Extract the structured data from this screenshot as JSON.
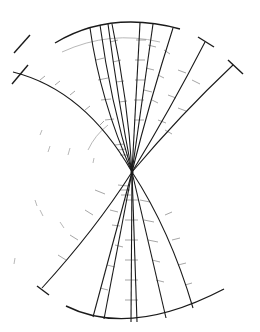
{
  "diagram": {
    "type": "particle-track-event",
    "width": 260,
    "height": 332,
    "colors": {
      "track": "#1a1a1a",
      "tick": "#444444",
      "faint": "#b8b8b8",
      "background": "#ffffff"
    },
    "vertex": {
      "x": 132,
      "y": 172
    },
    "boundary_arcs": [
      {
        "id": "top-arc",
        "d": "M55,43 Q110,10 180,29"
      },
      {
        "id": "bottom-arc",
        "d": "M66,306 Q130,338 224,289"
      },
      {
        "id": "left-upper-arc",
        "d": "M14,53 L30,35"
      }
    ],
    "faint_arcs": [
      {
        "d": "M62,52 Q110,30 160,42"
      },
      {
        "d": "M88,150 Q95,135 108,125"
      },
      {
        "d": "M40,135 L42,130"
      },
      {
        "d": "M48,152 L50,146"
      },
      {
        "d": "M68,155 L70,148"
      },
      {
        "d": "M93,163 L94,158"
      },
      {
        "d": "M35,200 L37,206"
      },
      {
        "d": "M40,210 L43,216"
      },
      {
        "d": "M60,222 L64,228"
      },
      {
        "d": "M15,258 L14,264"
      }
    ],
    "tracks_up": [
      {
        "id": "t1",
        "d": "M132,172 Q85,90 13,72",
        "cap": {
          "x1": 12,
          "y1": 84,
          "x2": 28,
          "y2": 65
        }
      },
      {
        "id": "t2",
        "d": "M132,172 Q100,100 90,28"
      },
      {
        "id": "t3",
        "d": "M132,172 Q110,100 100,25"
      },
      {
        "id": "t4",
        "d": "M132,172 Q118,100 108,24"
      },
      {
        "id": "t5",
        "d": "M132,172 Q128,100 112,24"
      },
      {
        "id": "t6",
        "d": "M132,172 L140,23"
      },
      {
        "id": "t7",
        "d": "M132,172 Q142,100 153,24"
      },
      {
        "id": "t8",
        "d": "M132,172 Q150,100 173,28"
      },
      {
        "id": "t9",
        "d": "M132,172 Q170,110 205,42",
        "cap": {
          "x1": 198,
          "y1": 37,
          "x2": 214,
          "y2": 47
        }
      },
      {
        "id": "t10",
        "d": "M132,172 Q180,115 233,65",
        "cap": {
          "x1": 228,
          "y1": 60,
          "x2": 243,
          "y2": 74
        }
      }
    ],
    "tracks_down": [
      {
        "id": "b1",
        "d": "M132,172 Q95,230 42,288",
        "cap": {
          "x1": 37,
          "y1": 286,
          "x2": 49,
          "y2": 295
        }
      },
      {
        "id": "b2",
        "d": "M132,172 L93,317"
      },
      {
        "id": "b3",
        "d": "M132,172 L104,319"
      },
      {
        "id": "b4",
        "d": "M132,172 L131,322"
      },
      {
        "id": "b5",
        "d": "M132,172 L137,322"
      },
      {
        "id": "b6",
        "d": "M132,172 L166,318"
      },
      {
        "id": "b7",
        "d": "M132,172 Q170,230 193,308"
      }
    ],
    "ticks": [
      [
        96,
        60,
        104,
        58
      ],
      [
        98,
        80,
        108,
        78
      ],
      [
        101,
        100,
        111,
        99
      ],
      [
        105,
        120,
        114,
        119
      ],
      [
        110,
        42,
        118,
        40
      ],
      [
        113,
        62,
        121,
        60
      ],
      [
        116,
        82,
        124,
        81
      ],
      [
        119,
        102,
        127,
        101
      ],
      [
        136,
        40,
        146,
        40
      ],
      [
        135,
        60,
        145,
        60
      ],
      [
        135,
        80,
        145,
        80
      ],
      [
        134,
        100,
        144,
        100
      ],
      [
        134,
        120,
        144,
        120
      ],
      [
        148,
        45,
        156,
        47
      ],
      [
        146,
        68,
        154,
        70
      ],
      [
        144,
        90,
        152,
        92
      ],
      [
        164,
        50,
        170,
        54
      ],
      [
        158,
        75,
        164,
        78
      ],
      [
        152,
        100,
        158,
        103
      ],
      [
        178,
        70,
        186,
        73
      ],
      [
        168,
        95,
        176,
        98
      ],
      [
        158,
        120,
        166,
        123
      ],
      [
        192,
        80,
        200,
        84
      ],
      [
        178,
        108,
        186,
        111
      ],
      [
        165,
        130,
        172,
        134
      ],
      [
        40,
        80,
        45,
        76
      ],
      [
        55,
        85,
        60,
        81
      ],
      [
        70,
        95,
        75,
        91
      ],
      [
        85,
        110,
        90,
        106
      ],
      [
        100,
        125,
        104,
        121
      ],
      [
        115,
        145,
        124,
        144
      ],
      [
        118,
        150,
        126,
        149
      ],
      [
        120,
        155,
        128,
        155
      ],
      [
        110,
        210,
        118,
        212
      ],
      [
        112,
        225,
        120,
        226
      ],
      [
        115,
        245,
        123,
        247
      ],
      [
        107,
        265,
        115,
        267
      ],
      [
        100,
        288,
        108,
        290
      ],
      [
        125,
        200,
        138,
        200
      ],
      [
        125,
        220,
        138,
        220
      ],
      [
        125,
        240,
        138,
        240
      ],
      [
        125,
        260,
        138,
        260
      ],
      [
        125,
        280,
        138,
        280
      ],
      [
        125,
        300,
        138,
        300
      ],
      [
        140,
        200,
        150,
        202
      ],
      [
        144,
        220,
        154,
        222
      ],
      [
        148,
        240,
        158,
        242
      ],
      [
        152,
        260,
        160,
        262
      ],
      [
        156,
        280,
        164,
        282
      ],
      [
        165,
        215,
        172,
        212
      ],
      [
        172,
        240,
        180,
        238
      ],
      [
        178,
        265,
        186,
        263
      ],
      [
        185,
        285,
        192,
        283
      ],
      [
        95,
        190,
        105,
        194
      ],
      [
        85,
        210,
        93,
        215
      ],
      [
        70,
        235,
        78,
        240
      ],
      [
        58,
        255,
        66,
        260
      ],
      [
        118,
        185,
        128,
        186
      ],
      [
        120,
        190,
        130,
        190
      ],
      [
        121,
        195,
        131,
        195
      ]
    ]
  }
}
